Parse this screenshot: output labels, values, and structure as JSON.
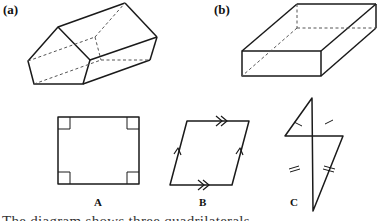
{
  "figures": {
    "a": {
      "label": "(a)",
      "description": "pentagonal prism"
    },
    "b": {
      "label": "(b)",
      "description": "cuboid"
    }
  },
  "shapes": [
    {
      "id": "A",
      "label": "A",
      "description": "rectangle with four right-angle marks"
    },
    {
      "id": "B",
      "label": "B",
      "description": "parallelogram with single and double arrow parallel marks"
    },
    {
      "id": "C",
      "label": "C",
      "description": "kite with single and double tick equal-side marks"
    }
  ],
  "caption": "The diagram shows three quadrilaterals"
}
